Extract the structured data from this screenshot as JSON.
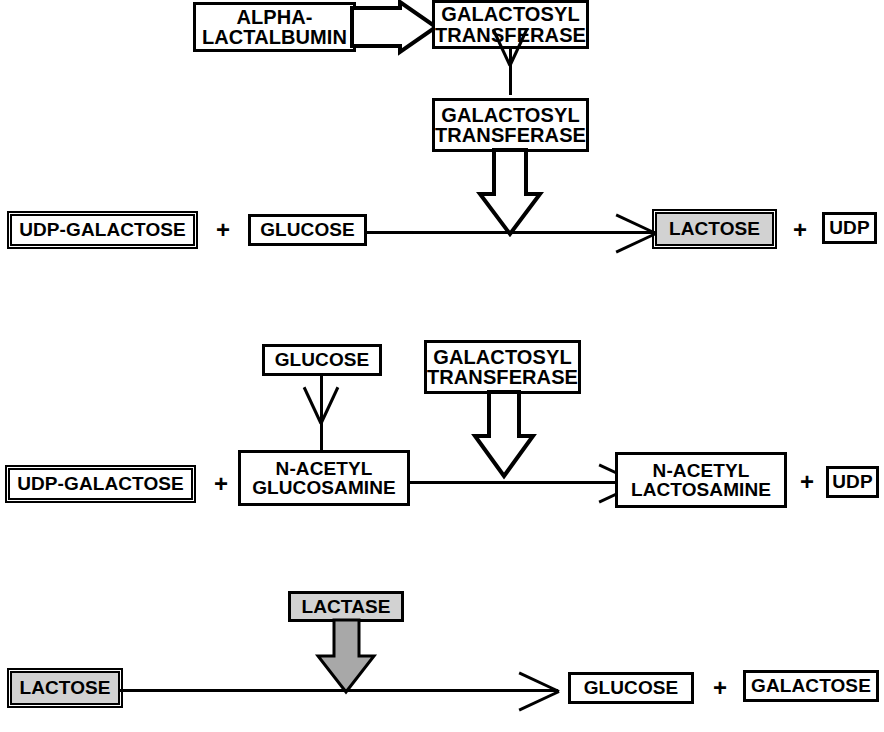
{
  "diagram": {
    "colors": {
      "stroke": "#000000",
      "background": "#ffffff",
      "shaded_fill": "#d2d2d2",
      "block_arrow_fill_hollow": "#ffffff",
      "block_arrow_fill_shaded": "#a8a8a8"
    }
  },
  "reaction1": {
    "name": "Lactose synthesis",
    "modifier_box": {
      "label": "ALPHA-\nLACTALBUMIN"
    },
    "enzyme_box_top": {
      "label": "GALACTOSYL\nTRANSFERASE"
    },
    "enzyme_box_bottom": {
      "label": "GALACTOSYL\nTRANSFERASE"
    },
    "substrate_1": {
      "label": "UDP-GALACTOSE"
    },
    "plus_1": "+",
    "substrate_2": {
      "label": "GLUCOSE"
    },
    "product_1": {
      "label": "LACTOSE"
    },
    "plus_2": "+",
    "product_2": {
      "label": "UDP"
    }
  },
  "reaction2": {
    "name": "N-acetyllactosamine synthesis",
    "modifier_box": {
      "label": "GLUCOSE"
    },
    "enzyme_box": {
      "label": "GALACTOSYL\nTRANSFERASE"
    },
    "substrate_1": {
      "label": "UDP-GALACTOSE"
    },
    "plus_1": "+",
    "substrate_2": {
      "label": "N-ACETYL\nGLUCOSAMINE"
    },
    "product_1": {
      "label": "N-ACETYL\nLACTOSAMINE"
    },
    "plus_2": "+",
    "product_2": {
      "label": "UDP"
    }
  },
  "reaction3": {
    "name": "Lactose hydrolysis",
    "enzyme_box": {
      "label": "LACTASE"
    },
    "substrate_1": {
      "label": "LACTOSE"
    },
    "product_1": {
      "label": "GLUCOSE"
    },
    "plus_1": "+",
    "product_2": {
      "label": "GALACTOSE"
    }
  }
}
